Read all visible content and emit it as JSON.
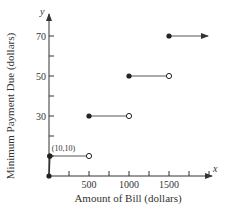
{
  "chart_data": {
    "type": "line",
    "subtype": "step",
    "title": "",
    "xlabel": "Amount of Bill (dollars)",
    "ylabel": "Minimum Payment Due (dollars)",
    "x_axis_symbol": "x",
    "y_axis_symbol": "y",
    "xlim": [
      0,
      2000
    ],
    "ylim": [
      0,
      80
    ],
    "x_ticks": [
      250,
      500,
      750,
      1000,
      1250,
      1500,
      1750,
      2000
    ],
    "x_tick_labels": [
      "500",
      "1000",
      "1500"
    ],
    "x_tick_label_values": [
      500,
      1000,
      1500
    ],
    "y_ticks": [
      10,
      20,
      30,
      40,
      50,
      60,
      70
    ],
    "y_tick_labels": [
      "30",
      "50",
      "70"
    ],
    "y_tick_label_values": [
      30,
      50,
      70
    ],
    "grid": false,
    "annotations": [
      {
        "text": "(10,10)",
        "x": 10,
        "y": 10
      }
    ],
    "segments": [
      {
        "x_start": 0,
        "y_start": 0,
        "x_end": 10,
        "y_end": 10,
        "start": "closed",
        "end": "closed"
      },
      {
        "x_start": 10,
        "x_end": 500,
        "y": 10,
        "start": "closed",
        "end": "open"
      },
      {
        "x_start": 500,
        "x_end": 1000,
        "y": 30,
        "start": "closed",
        "end": "open"
      },
      {
        "x_start": 1000,
        "x_end": 1500,
        "y": 50,
        "start": "closed",
        "end": "open"
      },
      {
        "x_start": 1500,
        "x_end": null,
        "y": 70,
        "start": "closed",
        "end": "arrow"
      }
    ],
    "colors": {
      "axis": "#333333",
      "line": "#555555",
      "point": "#222222"
    }
  }
}
